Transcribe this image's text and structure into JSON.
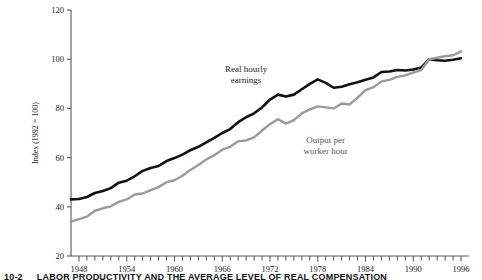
{
  "figure": {
    "caption_number": "10-2",
    "caption_text": "LABOR PRODUCTIVITY AND THE AVERAGE LEVEL OF REAL COMPENSATION"
  },
  "chart_data": {
    "type": "line",
    "title": "",
    "subtitle": "",
    "xlabel": "",
    "ylabel": "Index (1992 = 100)",
    "xlim": [
      1947,
      1997
    ],
    "ylim": [
      20,
      120
    ],
    "yticks": [
      20,
      40,
      60,
      80,
      100,
      120
    ],
    "xticks_labeled": [
      1948,
      1954,
      1960,
      1966,
      1972,
      1978,
      1984,
      1990,
      1996
    ],
    "xtick_interval": 1,
    "grid": false,
    "legend_position": "inline-annotations",
    "colors": {
      "real_hourly_earnings": "#111111",
      "output_per_worker_hour": "#9a9a9a",
      "axis": "#555555"
    },
    "annotations": [
      {
        "text": "Real hourly earnings",
        "x": 1969,
        "y": 95
      },
      {
        "text": "Output per worker hour",
        "x": 1979,
        "y": 66
      }
    ],
    "x": [
      1947,
      1948,
      1949,
      1950,
      1951,
      1952,
      1953,
      1954,
      1955,
      1956,
      1957,
      1958,
      1959,
      1960,
      1961,
      1962,
      1963,
      1964,
      1965,
      1966,
      1967,
      1968,
      1969,
      1970,
      1971,
      1972,
      1973,
      1974,
      1975,
      1976,
      1977,
      1978,
      1979,
      1980,
      1981,
      1982,
      1983,
      1984,
      1985,
      1986,
      1987,
      1988,
      1989,
      1990,
      1991,
      1992,
      1993,
      1994,
      1995,
      1996
    ],
    "series": [
      {
        "name": "Real hourly earnings",
        "color": "#111111",
        "values": [
          43.0,
          43.2,
          44.0,
          45.6,
          46.4,
          47.6,
          49.8,
          50.6,
          52.4,
          54.6,
          55.8,
          56.6,
          58.6,
          59.8,
          61.2,
          63.0,
          64.4,
          66.2,
          68.0,
          70.0,
          71.6,
          74.4,
          76.4,
          78.0,
          80.4,
          83.6,
          85.6,
          84.8,
          85.6,
          87.8,
          90.0,
          91.8,
          90.4,
          88.4,
          88.8,
          89.8,
          90.6,
          91.6,
          92.6,
          94.8,
          95.0,
          95.6,
          95.4,
          95.8,
          96.6,
          100.0,
          99.6,
          99.4,
          99.8,
          100.4
        ]
      },
      {
        "name": "Output per worker hour",
        "color": "#9a9a9a",
        "values": [
          34.0,
          35.0,
          36.0,
          38.4,
          39.4,
          40.2,
          42.0,
          43.0,
          45.0,
          45.4,
          46.8,
          48.0,
          50.0,
          50.8,
          52.6,
          55.0,
          57.0,
          59.2,
          61.0,
          63.2,
          64.4,
          66.6,
          67.0,
          68.2,
          71.0,
          73.6,
          75.6,
          73.8,
          75.2,
          78.0,
          79.6,
          80.8,
          80.4,
          80.0,
          82.0,
          81.6,
          84.4,
          87.4,
          88.6,
          91.0,
          91.6,
          92.8,
          93.4,
          94.6,
          95.6,
          100.0,
          100.6,
          101.2,
          101.6,
          103.2
        ]
      }
    ]
  }
}
